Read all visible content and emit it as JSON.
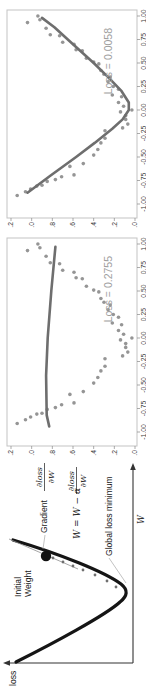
{
  "diagram": {
    "ylabel": "loss",
    "xlabel": "W",
    "initial_weight_line1": "Initial",
    "initial_weight_line2": "Weight",
    "gradient_label": "Gradient",
    "gradient_frac_numerator": "∂loss",
    "gradient_frac_denominator": "∂W",
    "equation_prefix": "W = W − α",
    "equation_frac_numerator": "∂loss",
    "equation_frac_denominator": "∂W",
    "global_minimum_label": "Global loss minimum",
    "colors": {
      "curve": "#151515",
      "initial_dot": "#111111",
      "pointer_line": "#a8a8a8",
      "step_dots": "#6f6f6f"
    }
  },
  "chart_data": [
    {
      "type": "scatter",
      "loss_label": "Loss = 0.2755",
      "xlim": [
        -1.0,
        1.0
      ],
      "ylim": [
        0.0,
        1.2
      ],
      "x_ticks": [
        "-1.00",
        "-0.75",
        "-0.50",
        "-0.25",
        "0.00",
        "0.25",
        "0.50",
        "0.75",
        "1.00"
      ],
      "x_tick_values": [
        -1.0,
        -0.75,
        -0.5,
        -0.25,
        0.0,
        0.25,
        0.5,
        0.75,
        1.0
      ],
      "y_ticks": [
        "0.0",
        "0.2",
        "0.4",
        "0.6",
        "0.8",
        "1.0",
        "1.2"
      ],
      "y_tick_values": [
        0.0,
        0.2,
        0.4,
        0.6,
        0.8,
        1.0,
        1.2
      ],
      "grid": false,
      "points": [
        [
          -0.91,
          1.14
        ],
        [
          -0.87,
          1.06
        ],
        [
          -0.84,
          1.01
        ],
        [
          -0.81,
          0.95
        ],
        [
          -0.8,
          0.9
        ],
        [
          -0.76,
          0.85
        ],
        [
          -0.74,
          0.77
        ],
        [
          -0.71,
          0.71
        ],
        [
          -0.69,
          0.59
        ],
        [
          -0.6,
          0.63
        ],
        [
          -0.57,
          0.5
        ],
        [
          -0.48,
          0.4
        ],
        [
          -0.42,
          0.36
        ],
        [
          -0.35,
          0.33
        ],
        [
          -0.3,
          0.29
        ],
        [
          -0.22,
          0.29
        ],
        [
          -0.19,
          0.12
        ],
        [
          -0.15,
          0.07
        ],
        [
          -0.1,
          0.09
        ],
        [
          -0.06,
          0.09
        ],
        [
          -0.02,
          0.14
        ],
        [
          0.0,
          0.03
        ],
        [
          0.04,
          0.11
        ],
        [
          0.08,
          0.16
        ],
        [
          0.14,
          0.13
        ],
        [
          0.16,
          0.22
        ],
        [
          0.22,
          0.16
        ],
        [
          0.25,
          0.21
        ],
        [
          0.3,
          0.26
        ],
        [
          0.35,
          0.24
        ],
        [
          0.38,
          0.3
        ],
        [
          0.42,
          0.33
        ],
        [
          0.49,
          0.35
        ],
        [
          0.51,
          0.4
        ],
        [
          0.55,
          0.47
        ],
        [
          0.63,
          0.51
        ],
        [
          0.64,
          0.57
        ],
        [
          0.7,
          0.59
        ],
        [
          0.72,
          0.7
        ],
        [
          0.79,
          0.73
        ],
        [
          0.8,
          0.82
        ],
        [
          0.87,
          0.86
        ],
        [
          0.93,
          1.04
        ],
        [
          0.96,
          0.92
        ],
        [
          1.0,
          0.94
        ]
      ],
      "fit_line": [
        [
          -0.94,
          0.83
        ],
        [
          -0.82,
          0.855
        ],
        [
          -0.4,
          0.86
        ],
        [
          0.0,
          0.845
        ],
        [
          0.5,
          0.81
        ],
        [
          0.97,
          0.77
        ]
      ],
      "colors": {
        "points": "#8a8a8a",
        "line": "#6e6e6e",
        "loss_text": "#9e9e9e"
      }
    },
    {
      "type": "scatter",
      "loss_label": "Loss = 0.0058",
      "xlim": [
        -1.0,
        1.0
      ],
      "ylim": [
        0.0,
        1.2
      ],
      "x_ticks": [
        "-1.00",
        "-0.75",
        "-0.50",
        "-0.25",
        "0.00",
        "0.25",
        "0.50",
        "0.75",
        "1.00"
      ],
      "x_tick_values": [
        -1.0,
        -0.75,
        -0.5,
        -0.25,
        0.0,
        0.25,
        0.5,
        0.75,
        1.0
      ],
      "y_ticks": [
        "0.0",
        "0.2",
        "0.4",
        "0.6",
        "0.8",
        "1.0",
        "1.2"
      ],
      "y_tick_values": [
        0.0,
        0.2,
        0.4,
        0.6,
        0.8,
        1.0,
        1.2
      ],
      "grid": false,
      "points": [
        [
          -0.91,
          1.14
        ],
        [
          -0.87,
          1.06
        ],
        [
          -0.84,
          1.01
        ],
        [
          -0.81,
          0.95
        ],
        [
          -0.8,
          0.9
        ],
        [
          -0.76,
          0.85
        ],
        [
          -0.74,
          0.77
        ],
        [
          -0.71,
          0.71
        ],
        [
          -0.69,
          0.59
        ],
        [
          -0.6,
          0.63
        ],
        [
          -0.57,
          0.5
        ],
        [
          -0.48,
          0.4
        ],
        [
          -0.42,
          0.36
        ],
        [
          -0.35,
          0.33
        ],
        [
          -0.3,
          0.29
        ],
        [
          -0.22,
          0.29
        ],
        [
          -0.19,
          0.12
        ],
        [
          -0.15,
          0.07
        ],
        [
          -0.1,
          0.09
        ],
        [
          -0.06,
          0.09
        ],
        [
          -0.02,
          0.14
        ],
        [
          0.0,
          0.03
        ],
        [
          0.04,
          0.11
        ],
        [
          0.08,
          0.16
        ],
        [
          0.14,
          0.13
        ],
        [
          0.16,
          0.22
        ],
        [
          0.22,
          0.16
        ],
        [
          0.25,
          0.21
        ],
        [
          0.3,
          0.26
        ],
        [
          0.35,
          0.24
        ],
        [
          0.38,
          0.3
        ],
        [
          0.42,
          0.33
        ],
        [
          0.49,
          0.35
        ],
        [
          0.51,
          0.4
        ],
        [
          0.55,
          0.47
        ],
        [
          0.63,
          0.51
        ],
        [
          0.64,
          0.57
        ],
        [
          0.7,
          0.59
        ],
        [
          0.72,
          0.7
        ],
        [
          0.79,
          0.73
        ],
        [
          0.8,
          0.82
        ],
        [
          0.87,
          0.86
        ],
        [
          0.93,
          1.04
        ],
        [
          0.96,
          0.92
        ],
        [
          1.0,
          0.94
        ]
      ],
      "fit_line": [
        [
          -0.88,
          1.04
        ],
        [
          -0.7,
          0.82
        ],
        [
          -0.5,
          0.57
        ],
        [
          -0.35,
          0.39
        ],
        [
          -0.2,
          0.22
        ],
        [
          -0.1,
          0.12
        ],
        [
          0.0,
          0.06
        ],
        [
          0.08,
          0.06
        ],
        [
          0.2,
          0.13
        ],
        [
          0.35,
          0.26
        ],
        [
          0.5,
          0.4
        ],
        [
          0.7,
          0.6
        ],
        [
          0.88,
          0.78
        ],
        [
          0.98,
          0.9
        ]
      ],
      "colors": {
        "points": "#8a8a8a",
        "line": "#6e6e6e",
        "loss_text": "#9e9e9e"
      }
    }
  ]
}
